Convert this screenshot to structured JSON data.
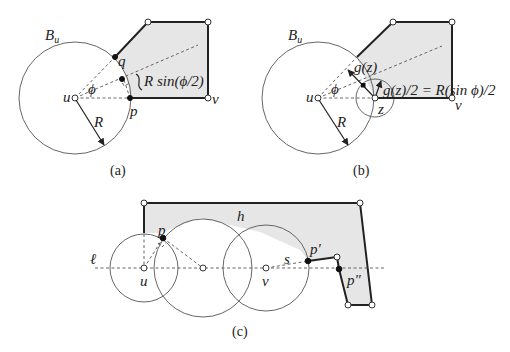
{
  "figure": {
    "panels": [
      {
        "id": "a",
        "caption": "(a)",
        "labels": {
          "ball": "B",
          "ball_sub": "u",
          "q": "q",
          "p": "p",
          "u": "u",
          "v": "v",
          "phi": "ϕ",
          "R": "R",
          "distance": "R sin(ϕ/2)"
        }
      },
      {
        "id": "b",
        "caption": "(b)",
        "labels": {
          "ball": "B",
          "ball_sub": "u",
          "gz": "g(z)",
          "phi": "ϕ",
          "u": "u",
          "z": "z",
          "v": "v",
          "R": "R",
          "equation": "g(z)/2 = R(sin ϕ)/2"
        }
      },
      {
        "id": "c",
        "caption": "(c)",
        "labels": {
          "h": "h",
          "p": "p",
          "ell": "ℓ",
          "u": "u",
          "v": "v",
          "s": "s",
          "p_prime": "p′",
          "p_dprime": "p″"
        }
      }
    ],
    "colors": {
      "polygon_fill": "#e6e6e6",
      "edge": "#222222",
      "circle": "#555555"
    }
  }
}
